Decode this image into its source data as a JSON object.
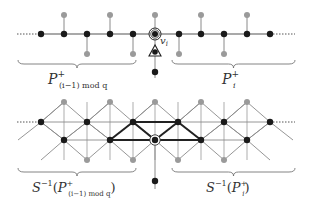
{
  "colors": {
    "black_node": "#1a1a1a",
    "grey_node": "#9a9a9a",
    "edge": "#555555",
    "light_edge": "#8a8a8a",
    "thick_edge": "#222222",
    "brace": "#666666"
  },
  "top_path": {
    "y": 34,
    "black_nodes_x": [
      41,
      64,
      87,
      110,
      133,
      179,
      201,
      224,
      247,
      270
    ],
    "special_node": {
      "x": 155,
      "y": 34,
      "label": "v",
      "label_sub": "i"
    },
    "grey_above": {
      "y": 15,
      "x": [
        64,
        110,
        155,
        201,
        247
      ]
    },
    "grey_below": {
      "y": 54,
      "x": [
        87,
        133,
        179,
        224
      ]
    },
    "triangle_node": {
      "x": 155,
      "y": 52
    },
    "bottom_black_node": {
      "x": 155,
      "y": 72
    },
    "left_brace_label": {
      "main": "P",
      "sup": "+",
      "sub": "(i−1) mod q"
    },
    "right_brace_label": {
      "main": "P",
      "sup": "+",
      "sub": "i"
    }
  },
  "lattice": {
    "upper_row": {
      "y": 122,
      "x": [
        41,
        87,
        133,
        178,
        224,
        270
      ]
    },
    "grey_top": {
      "y": 102,
      "x": [
        64,
        110,
        155,
        201,
        247
      ]
    },
    "lower_row": {
      "y": 140,
      "x": [
        64,
        110,
        201,
        247
      ]
    },
    "special_node": {
      "x": 155,
      "y": 140
    },
    "grey_bottom": {
      "y": 160,
      "x": [
        87,
        133,
        178,
        224
      ]
    },
    "bottom_black_node": {
      "x": 155,
      "y": 181
    },
    "left_brace_label": {
      "prefix": "S",
      "inv": "−1",
      "open": "(",
      "main": "P",
      "sup": "+",
      "sub": "(i−1) mod q",
      "close": ")"
    },
    "right_brace_label": {
      "prefix": "S",
      "inv": "−1",
      "open": "(",
      "main": "P",
      "sup": "+",
      "sub": "i",
      "close": ")"
    }
  }
}
